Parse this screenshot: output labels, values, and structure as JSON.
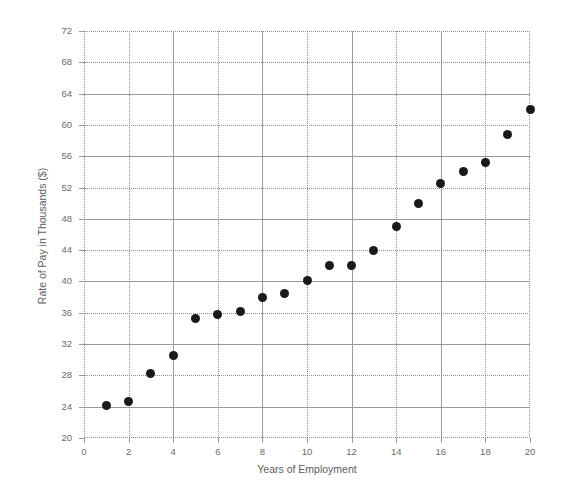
{
  "chart_data": {
    "type": "scatter",
    "title": "",
    "xlabel": "Years of Employment",
    "ylabel": "Rate of Pay in Thousands ($)",
    "xlim": [
      0,
      20
    ],
    "ylim": [
      20,
      72
    ],
    "x_ticks": [
      0,
      2,
      4,
      6,
      8,
      10,
      12,
      14,
      16,
      18,
      20
    ],
    "y_ticks": [
      20,
      24,
      28,
      32,
      36,
      40,
      44,
      48,
      52,
      56,
      60,
      64,
      68,
      72
    ],
    "x_tick_labels": [
      "0",
      "2",
      "4",
      "6",
      "8",
      "10",
      "12",
      "14",
      "16",
      "18",
      "20"
    ],
    "y_tick_labels": [
      "20",
      "24",
      "28",
      "32",
      "36",
      "40",
      "44",
      "48",
      "52",
      "56",
      "60",
      "64",
      "68",
      "72"
    ],
    "grid": true,
    "legend": false,
    "marker_color": "#1a1a1a",
    "x": [
      1,
      2,
      3,
      4,
      5,
      6,
      7,
      8,
      9,
      10,
      11,
      12,
      13,
      14,
      15,
      16,
      17,
      18,
      19,
      20
    ],
    "y": [
      24.2,
      24.6,
      28.2,
      30.6,
      35.3,
      35.8,
      36.1,
      38.0,
      38.4,
      40.1,
      42.0,
      42.0,
      44.0,
      47.0,
      50.0,
      52.5,
      54.0,
      55.2,
      58.8,
      62.0
    ],
    "points": [
      {
        "x": 1,
        "y": 24.2
      },
      {
        "x": 2,
        "y": 24.6
      },
      {
        "x": 3,
        "y": 28.2
      },
      {
        "x": 4,
        "y": 30.6
      },
      {
        "x": 5,
        "y": 35.3
      },
      {
        "x": 6,
        "y": 35.8
      },
      {
        "x": 7,
        "y": 36.1
      },
      {
        "x": 8,
        "y": 38.0
      },
      {
        "x": 9,
        "y": 38.4
      },
      {
        "x": 10,
        "y": 40.1
      },
      {
        "x": 11,
        "y": 42.0
      },
      {
        "x": 12,
        "y": 42.0
      },
      {
        "x": 13,
        "y": 44.0
      },
      {
        "x": 14,
        "y": 47.0
      },
      {
        "x": 15,
        "y": 50.0
      },
      {
        "x": 16,
        "y": 52.5
      },
      {
        "x": 17,
        "y": 54.0
      },
      {
        "x": 18,
        "y": 55.2
      },
      {
        "x": 19,
        "y": 58.8
      },
      {
        "x": 20,
        "y": 62.0
      }
    ]
  }
}
